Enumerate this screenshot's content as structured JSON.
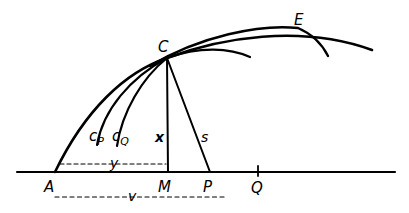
{
  "figure": {
    "stroke_color": "#000000",
    "background": "#ffffff",
    "points": {
      "A": "A",
      "M": "M",
      "P": "P",
      "Q": "Q",
      "C": "C",
      "E": "E"
    },
    "curve_labels": {
      "cP_main": "c",
      "cP_sub": "P",
      "cQ_main": "c",
      "cQ_sub": "Q"
    },
    "segment_labels": {
      "x": "x",
      "s": "s",
      "y": "y",
      "v": "v"
    }
  }
}
